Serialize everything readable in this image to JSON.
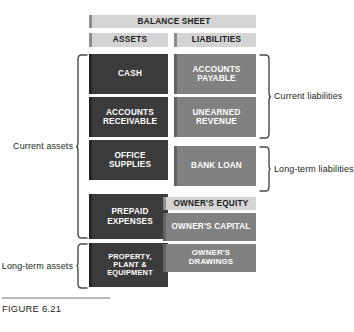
{
  "figure": {
    "caption": "FIGURE 6.21"
  },
  "colors": {
    "asset_box": "#3b3b3b",
    "liability_box": "#818181",
    "header_bar": "#d4d4d4",
    "text_on_dark": "#ffffff",
    "text_on_light": "#1c1c1c",
    "bracket_line": "#4a4a4a",
    "caption_rule": "#b9b9b9",
    "page_background": "#ffffff"
  },
  "headers": {
    "title": "BALANCE SHEET",
    "assets": "ASSETS",
    "liabilities": "LIABILITIES",
    "owners_equity": "OWNER'S EQUITY"
  },
  "assets": {
    "items": [
      {
        "label": "CASH"
      },
      {
        "label": "ACCOUNTS\nRECEIVABLE"
      },
      {
        "label": "OFFICE\nSUPPLIES"
      },
      {
        "label": "PREPAID\nEXPENSES"
      },
      {
        "label": "PROPERTY, PLANT &\nEQUIPMENT"
      }
    ]
  },
  "liabilities": {
    "items": [
      {
        "label": "ACCOUNTS\nPAYABLE"
      },
      {
        "label": "UNEARNED\nREVENUE"
      },
      {
        "label": "BANK LOAN"
      }
    ]
  },
  "equity": {
    "items": [
      {
        "label": "OWNER'S CAPITAL"
      },
      {
        "label": "OWNER'S DRAWINGS"
      }
    ]
  },
  "brackets": {
    "current_assets": "Current assets",
    "long_term_assets": "Long-term assets",
    "current_liabilities": "Current liabilities",
    "long_term_liabilities": "Long-term liabilities"
  }
}
